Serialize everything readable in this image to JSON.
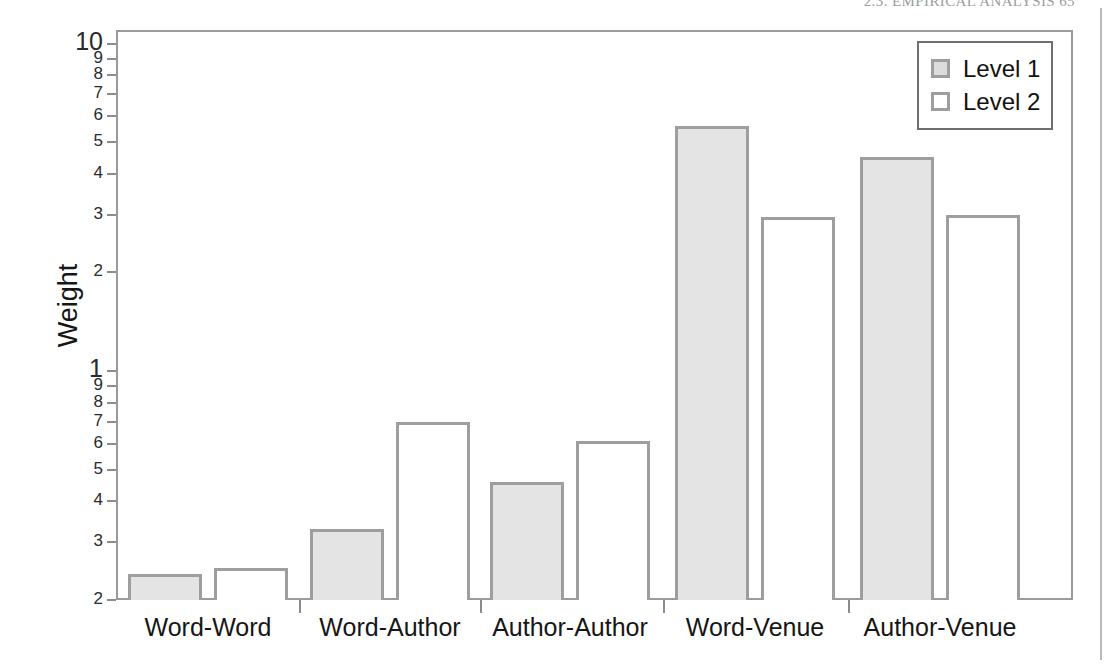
{
  "page": {
    "running_head": "2.3.  EMPIRICAL ANALYSIS      65"
  },
  "chart_data": {
    "type": "bar",
    "title": "",
    "xlabel": "",
    "ylabel": "Weight",
    "yscale": "log",
    "ylim": [
      0.2,
      11.0
    ],
    "grid": false,
    "legend_position": "top-right",
    "categories": [
      "Word-Word",
      "Word-Author",
      "Author-Author",
      "Word-Venue",
      "Author-Venue"
    ],
    "series": [
      {
        "name": "Level 1",
        "fill": "#e4e4e4",
        "stroke": "#9e9e9e",
        "values": [
          0.24,
          0.33,
          0.46,
          5.6,
          4.5
        ]
      },
      {
        "name": "Level 2",
        "fill": "#ffffff",
        "stroke": "#9e9e9e",
        "values": [
          0.25,
          0.7,
          0.61,
          2.95,
          3.0
        ]
      }
    ],
    "y_ticks": [
      {
        "value": 10,
        "label": "10",
        "major": true
      },
      {
        "value": 9,
        "label": "9",
        "major": false
      },
      {
        "value": 8,
        "label": "8",
        "major": false
      },
      {
        "value": 7,
        "label": "7",
        "major": false
      },
      {
        "value": 6,
        "label": "6",
        "major": false
      },
      {
        "value": 5,
        "label": "5",
        "major": false
      },
      {
        "value": 4,
        "label": "4",
        "major": false
      },
      {
        "value": 3,
        "label": "3",
        "major": false
      },
      {
        "value": 2,
        "label": "2",
        "major": false
      },
      {
        "value": 1,
        "label": "1",
        "major": true
      },
      {
        "value": 0.9,
        "label": "9",
        "major": false
      },
      {
        "value": 0.8,
        "label": "8",
        "major": false
      },
      {
        "value": 0.7,
        "label": "7",
        "major": false
      },
      {
        "value": 0.6,
        "label": "6",
        "major": false
      },
      {
        "value": 0.5,
        "label": "5",
        "major": false
      },
      {
        "value": 0.4,
        "label": "4",
        "major": false
      },
      {
        "value": 0.3,
        "label": "3",
        "major": false
      },
      {
        "value": 0.2,
        "label": "2",
        "major": false
      }
    ]
  },
  "geometry": {
    "plot_left": 116,
    "plot_right": 1073,
    "plot_top": 30,
    "plot_bottom": 600,
    "y_top_value": 11.0,
    "y_bottom_value": 0.2,
    "group_centers": [
      208,
      390,
      570,
      755,
      940
    ],
    "bar_width": 74,
    "bar_gap": 12
  }
}
